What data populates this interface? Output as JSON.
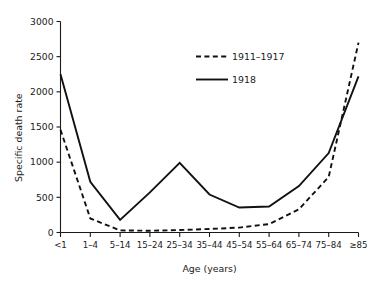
{
  "chart_data": {
    "type": "line",
    "title": "",
    "xlabel": "Age (years)",
    "ylabel": "Specific death rate",
    "categories": [
      "<1",
      "1–4",
      "5–14",
      "15–24",
      "25–34",
      "35–44",
      "45–54",
      "55–64",
      "65–74",
      "75–84",
      "≥85"
    ],
    "series": [
      {
        "name": "1911–1917",
        "style": "dashed",
        "color": "#111111",
        "values": [
          1460,
          200,
          30,
          25,
          35,
          50,
          70,
          120,
          330,
          790,
          2700
        ]
      },
      {
        "name": "1918",
        "style": "solid",
        "color": "#111111",
        "values": [
          2250,
          720,
          180,
          570,
          990,
          540,
          355,
          370,
          660,
          1130,
          2220
        ]
      }
    ],
    "ylim": [
      0,
      3000
    ],
    "yticks": [
      0,
      500,
      1000,
      1500,
      2000,
      2500,
      3000
    ],
    "ytick_labels": [
      "0",
      "500",
      "1000",
      "1500",
      "2000",
      "2500",
      "3000"
    ],
    "grid": false,
    "legend_position": "upper-center"
  },
  "legend": {
    "entries": [
      {
        "label": "1911–1917",
        "style": "dashed"
      },
      {
        "label": "1918",
        "style": "solid"
      }
    ]
  },
  "axes": {
    "y_title": "Specific death rate",
    "x_title": "Age (years)"
  }
}
